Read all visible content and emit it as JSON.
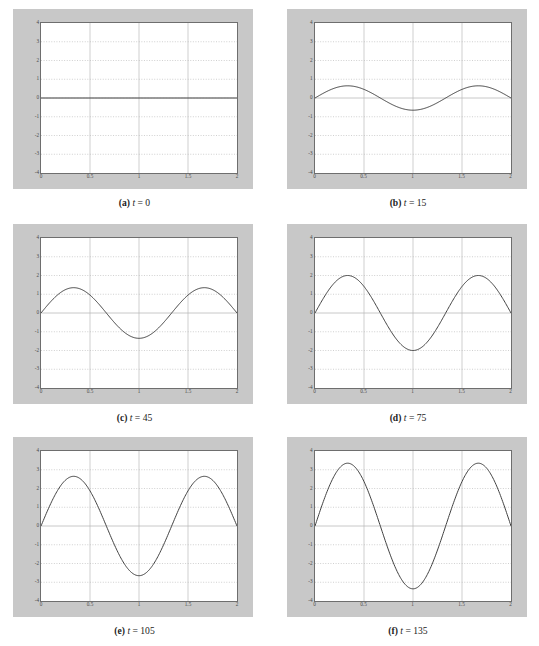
{
  "figure": {
    "panel_background": "#c8c8c8",
    "plot_background": "#ffffff",
    "frame_color": "#6e6e6e",
    "grid_color": "#b9b9b9",
    "curve_color": "#404040"
  },
  "axes": {
    "xlim": [
      0,
      2
    ],
    "ylim": [
      -4,
      4
    ],
    "xticks": [
      "0",
      "0.5",
      "1",
      "1.5",
      "2"
    ],
    "xtick_values": [
      0,
      0.5,
      1,
      1.5,
      2
    ],
    "yticks": [
      "4",
      "3",
      "2",
      "1",
      "0",
      "-1",
      "-2",
      "-3",
      "-4"
    ],
    "ytick_values": [
      4,
      3,
      2,
      1,
      0,
      -1,
      -2,
      -3,
      -4
    ],
    "grid": true,
    "xlabel": "",
    "ylabel": ""
  },
  "chart_data": {
    "type": "line",
    "title": "",
    "xlabel": "",
    "ylabel": "",
    "xlim": [
      0,
      2
    ],
    "ylim": [
      -4,
      4
    ],
    "grid": true,
    "legend_position": "none",
    "shared_x_note": "x sampled 0 to 2",
    "waveform": "y(x) = A * sin(3*pi*x/2)",
    "zeros": [
      0,
      0.667,
      1.333,
      2
    ],
    "peak_x": [
      0.333,
      1.667
    ],
    "trough_x": [
      1.0
    ],
    "panels": [
      {
        "id": "a",
        "label": "(a)",
        "variable": "t",
        "equals": "=",
        "t": "0",
        "caption": "(a) t = 0",
        "amplitude": 0,
        "series": [
          {
            "name": "t = 0",
            "x": [
              0,
              0.1667,
              0.3333,
              0.5,
              0.6667,
              0.8333,
              1.0,
              1.1667,
              1.3333,
              1.5,
              1.6667,
              1.8333,
              2.0
            ],
            "values": [
              0,
              0,
              0,
              0,
              0,
              0,
              0,
              0,
              0,
              0,
              0,
              0,
              0
            ]
          }
        ]
      },
      {
        "id": "b",
        "label": "(b)",
        "variable": "t",
        "equals": "=",
        "t": "15",
        "caption": "(b) t = 15",
        "amplitude": 0.65,
        "series": [
          {
            "name": "t = 15",
            "x": [
              0,
              0.1667,
              0.3333,
              0.5,
              0.6667,
              0.8333,
              1.0,
              1.1667,
              1.3333,
              1.5,
              1.6667,
              1.8333,
              2.0
            ],
            "values": [
              0,
              0.46,
              0.65,
              0.46,
              0,
              -0.46,
              -0.65,
              -0.46,
              0,
              0.46,
              0.65,
              0.46,
              0
            ]
          }
        ]
      },
      {
        "id": "c",
        "label": "(c)",
        "variable": "t",
        "equals": "=",
        "t": "45",
        "caption": "(c) t = 45",
        "amplitude": 1.35,
        "series": [
          {
            "name": "t = 45",
            "x": [
              0,
              0.1667,
              0.3333,
              0.5,
              0.6667,
              0.8333,
              1.0,
              1.1667,
              1.3333,
              1.5,
              1.6667,
              1.8333,
              2.0
            ],
            "values": [
              0,
              0.95,
              1.35,
              0.95,
              0,
              -0.95,
              -1.35,
              -0.95,
              0,
              0.95,
              1.35,
              0.95,
              0
            ]
          }
        ]
      },
      {
        "id": "d",
        "label": "(d)",
        "variable": "t",
        "equals": "=",
        "t": "75",
        "caption": "(d) t = 75",
        "amplitude": 2.0,
        "series": [
          {
            "name": "t = 75",
            "x": [
              0,
              0.1667,
              0.3333,
              0.5,
              0.6667,
              0.8333,
              1.0,
              1.1667,
              1.3333,
              1.5,
              1.6667,
              1.8333,
              2.0
            ],
            "values": [
              0,
              1.41,
              2.0,
              1.41,
              0,
              -1.41,
              -2.0,
              -1.41,
              0,
              1.41,
              2.0,
              1.41,
              0
            ]
          }
        ]
      },
      {
        "id": "e",
        "label": "(e)",
        "variable": "t",
        "equals": "=",
        "t": "105",
        "caption": "(e) t = 105",
        "amplitude": 2.65,
        "series": [
          {
            "name": "t = 105",
            "x": [
              0,
              0.1667,
              0.3333,
              0.5,
              0.6667,
              0.8333,
              1.0,
              1.1667,
              1.3333,
              1.5,
              1.6667,
              1.8333,
              2.0
            ],
            "values": [
              0,
              1.87,
              2.65,
              1.87,
              0,
              -1.87,
              -2.65,
              -1.87,
              0,
              1.87,
              2.65,
              1.87,
              0
            ]
          }
        ]
      },
      {
        "id": "f",
        "label": "(f)",
        "variable": "t",
        "equals": "=",
        "t": "135",
        "caption": "(f) t = 135",
        "amplitude": 3.35,
        "series": [
          {
            "name": "t = 135",
            "x": [
              0,
              0.1667,
              0.3333,
              0.5,
              0.6667,
              0.8333,
              1.0,
              1.1667,
              1.3333,
              1.5,
              1.6667,
              1.8333,
              2.0
            ],
            "values": [
              0,
              2.37,
              3.35,
              2.37,
              0,
              -2.37,
              -3.35,
              -2.37,
              0,
              2.37,
              3.35,
              2.37,
              0
            ]
          }
        ]
      }
    ]
  }
}
